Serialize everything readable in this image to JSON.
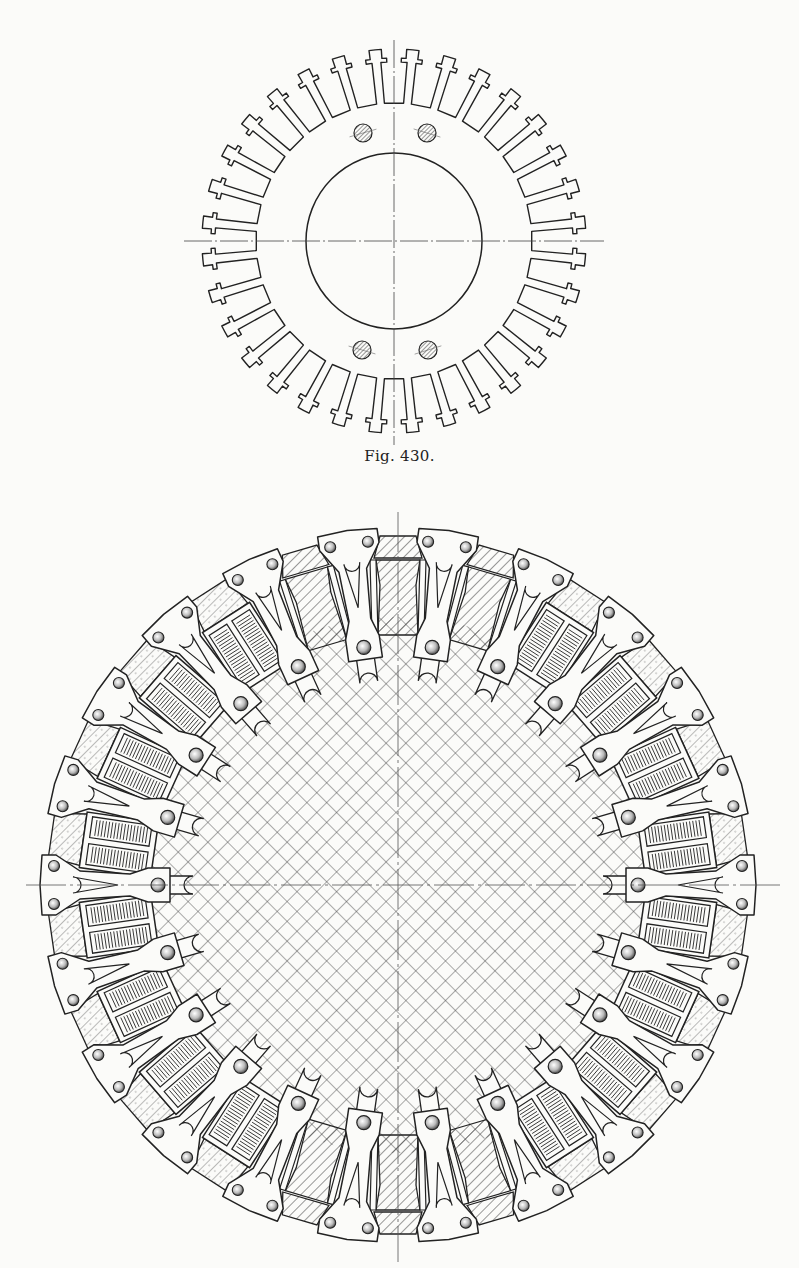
{
  "page": {
    "background": "#fbfbf9",
    "ink": "#222222"
  },
  "figures": [
    {
      "id": "fig430",
      "caption": "Fig. 430.",
      "caption_y": 447,
      "subject": "stator-lamination",
      "center": [
        394,
        241
      ],
      "outer_radius": 192,
      "slot_depth": 54,
      "slot_count": 32,
      "slot_width_deg": 4.2,
      "inner_bore_radius": 88,
      "bolt_holes": [
        [
          363,
          133
        ],
        [
          427,
          133
        ],
        [
          362,
          350
        ],
        [
          428,
          350
        ]
      ],
      "bolt_hole_radius": 9,
      "centerlines": {
        "h": [
          184,
          604
        ],
        "v": [
          40,
          445
        ]
      }
    },
    {
      "id": "fig431",
      "caption": "",
      "subject": "rotor-with-pole-clamps",
      "center": [
        398,
        885
      ],
      "outer_radius": 357,
      "arm_count": 22,
      "arm_offset_deg": 180,
      "hub_radius": 250,
      "coil_slot_type": "coil-pack",
      "wedge_slot_indices": [
        5,
        10,
        16,
        21,
        0,
        11
      ],
      "centerlines": {
        "h": [
          26,
          780
        ],
        "v": [
          512,
          1262
        ]
      }
    }
  ]
}
